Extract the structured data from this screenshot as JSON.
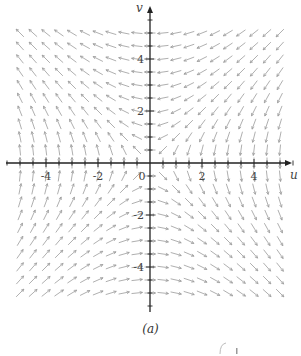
{
  "figure": {
    "caption": "(a)",
    "background": "#ffffff",
    "arrow_color": "#9a9a9a",
    "axis_color": "#222222"
  },
  "chart_data": {
    "type": "quiver",
    "title": "",
    "xlabel": "u",
    "ylabel": "v",
    "xlim": [
      -5.5,
      5.5
    ],
    "ylim": [
      -5.5,
      5.5
    ],
    "grid": false,
    "x_ticks": [
      -4,
      -2,
      0,
      2,
      4
    ],
    "y_ticks": [
      -4,
      -2,
      2,
      4
    ],
    "x_tick_labels": [
      "-4",
      "-2",
      "0",
      "2",
      "4"
    ],
    "y_tick_labels": [
      "-4",
      "-2",
      "2",
      "4"
    ],
    "minor_tick_step": 0.5,
    "field": {
      "du": "-v",
      "dv": "-u",
      "normalized": true
    },
    "sample_spacing": 0.5,
    "sample_range": [
      -5,
      5
    ]
  }
}
